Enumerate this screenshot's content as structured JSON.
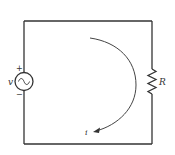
{
  "diagram": {
    "type": "circuit",
    "components": [
      {
        "id": "source",
        "kind": "ac-voltage-source",
        "label": "v",
        "polarity_top": "+",
        "polarity_bottom": "−"
      },
      {
        "id": "resistor",
        "kind": "resistor",
        "label": "R"
      }
    ],
    "current": {
      "label": "i",
      "direction": "clockwise-arc"
    },
    "colors": {
      "stroke": "#333333",
      "background": "#ffffff"
    }
  }
}
